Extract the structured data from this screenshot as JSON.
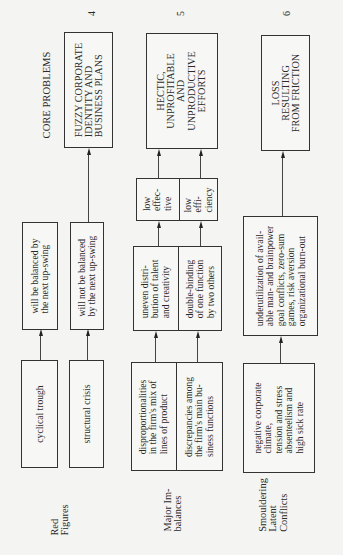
{
  "header": {
    "column_title": "CORE PROBLEMS",
    "numbers": [
      "4",
      "5",
      "6"
    ]
  },
  "core_problems": [
    {
      "number": "4",
      "text": "FUZZY CORPORATE\nIDENTITY AND\nBUSINESS PLANS"
    },
    {
      "number": "5",
      "text": "HECTIC,\nUNPROFITABLE\nAND\nUNPRODUCTIVE\nEFFORTS"
    },
    {
      "number": "6",
      "text": "LOSS\nRESULTING\nFROM FRICTION"
    }
  ],
  "rows": [
    {
      "label": "Red\nFigures",
      "causes": [
        "cyclical trough",
        "structural crisis"
      ],
      "effects": [
        "will be balanced by\nthe next up-swing",
        "will not be balanced\nby the next up-swing"
      ]
    },
    {
      "label": "Major Im-\nbalances",
      "causes": [
        "disproportionalities\nin the firm's mix of\nlines of product",
        "discrepancies among\nthe firm's main bu-\nsiness functions"
      ],
      "effects": [
        "uneven distri-\nbution of talent\nand creativity",
        "double-binding\nof one function\nby two others"
      ],
      "outcomes": [
        "low\neffec-\ntive",
        "low\neffi-\nciency"
      ]
    },
    {
      "label": "Smouldering\nLatent\nConflicts",
      "causes": [
        "negative corporate\nclimate,\ntension and stress\nabsenteelism and\nhigh sick rate"
      ],
      "effects": [
        "underutilization of avail-\nable man- and brainpower\ngoal conflicts, zero-sum\ngames, risk aversion\norganizational burn-out"
      ]
    }
  ]
}
